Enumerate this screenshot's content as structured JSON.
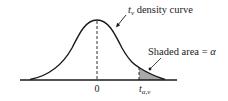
{
  "figure": {
    "curve_label": {
      "symbol": "t",
      "subscript": "ν",
      "text": " density curve"
    },
    "area_label": {
      "text": "Shaded area = ",
      "symbol": "α"
    },
    "axis": {
      "center_tick": "0",
      "critical_tick": {
        "symbol": "t",
        "subscript": "α,ν"
      }
    },
    "colors": {
      "line": "#1a1a1a",
      "shade": "#a9a9a9",
      "background": "#ffffff"
    }
  }
}
